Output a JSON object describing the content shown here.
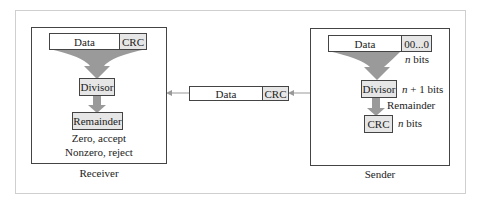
{
  "receiver": {
    "title": "Receiver",
    "data_label": "Data",
    "crc_label": "CRC",
    "divisor_label": "Divisor",
    "remainder_label": "Remainder",
    "result_zero": "Zero, accept",
    "result_nonzero": "Nonzero, reject"
  },
  "channel": {
    "data_label": "Data",
    "crc_label": "CRC"
  },
  "sender": {
    "title": "Sender",
    "data_label": "Data",
    "padding_label": "00...0",
    "padding_bits_n": "n",
    "padding_bits_suffix": " bits",
    "divisor_label": "Divisor",
    "divisor_bits_n": "n",
    "divisor_bits_suffix": " + 1 bits",
    "remainder_label": "Remainder",
    "crc_label": "CRC",
    "crc_bits_n": "n",
    "crc_bits_suffix": " bits"
  },
  "colors": {
    "arrow_fill": "#9a9a9a",
    "box_shade": "#e6e6e6",
    "frame_border": "#cfcfcf"
  }
}
